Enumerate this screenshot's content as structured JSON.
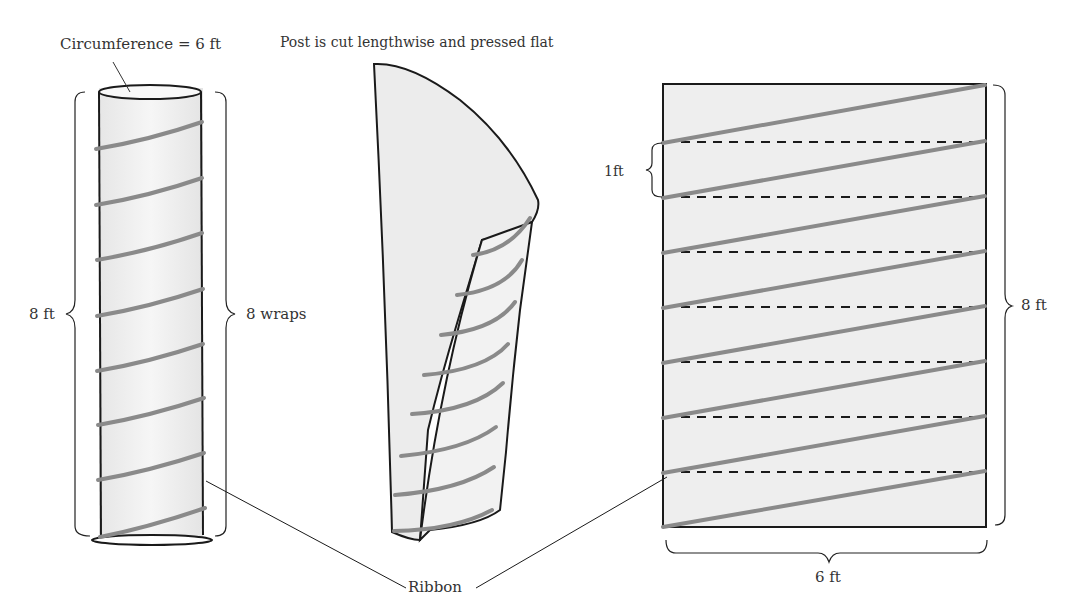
{
  "labels": {
    "circumference": "Circumference = 6 ft",
    "caption": "Post is cut lengthwise and pressed flat",
    "height_left": "8 ft",
    "wraps": "8 wraps",
    "one_ft": "1ft",
    "height_right": "8 ft",
    "width_bottom": "6 ft",
    "ribbon": "Ribbon"
  },
  "colors": {
    "outline": "#1a1a1a",
    "ribbon": "#8a8a8a",
    "fill": "#eeeeee",
    "text": "#333333"
  },
  "diagram": {
    "post_circumference_ft": 6,
    "post_height_ft": 8,
    "wraps": 8,
    "spacing_ft": 1
  }
}
